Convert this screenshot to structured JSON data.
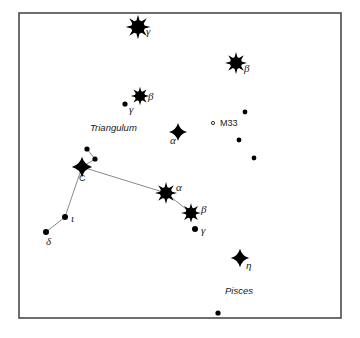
{
  "figure": {
    "background_color": "#ffffff",
    "frame": {
      "x": 19,
      "y": 13,
      "width": 322,
      "height": 305,
      "stroke_color": "#4a4a4a"
    },
    "line_color": "#7b7b7b",
    "star_color": "#000000"
  },
  "chart_data": {
    "type": "scatter",
    "xlabel": "",
    "ylabel": "",
    "grid": false,
    "legend": "none",
    "xlim": [
      19,
      341
    ],
    "ylim": [
      13,
      318
    ],
    "stars": [
      {
        "id": "and-gamma",
        "label": "γ",
        "glyph": "spiked",
        "size": 8.5,
        "x": 138,
        "y": 27,
        "label_dx": 8,
        "label_dy": 8
      },
      {
        "id": "and-beta",
        "label": "β",
        "glyph": "spiked",
        "size": 7.6,
        "x": 236,
        "y": 63,
        "label_dx": 8,
        "label_dy": 9
      },
      {
        "id": "tri-beta",
        "label": "β",
        "glyph": "spiked",
        "size": 6.4,
        "x": 140,
        "y": 96,
        "label_dx": 8,
        "label_dy": 4
      },
      {
        "id": "tri-gamma",
        "label": "γ",
        "glyph": "dot",
        "size": 2.6,
        "x": 125,
        "y": 104,
        "label_dx": 4,
        "label_dy": 9
      },
      {
        "id": "tri-alpha",
        "label": "α",
        "glyph": "diamond",
        "size": 6.2,
        "x": 178,
        "y": 132,
        "label_dx": -8,
        "label_dy": 12
      },
      {
        "id": "field-1",
        "label": "",
        "glyph": "dot",
        "size": 2.4,
        "x": 245,
        "y": 112,
        "label_dx": 0,
        "label_dy": 0
      },
      {
        "id": "field-2",
        "label": "",
        "glyph": "dot",
        "size": 2.4,
        "x": 239,
        "y": 140,
        "label_dx": 0,
        "label_dy": 0
      },
      {
        "id": "field-3",
        "label": "",
        "glyph": "dot",
        "size": 2.4,
        "x": 254,
        "y": 158,
        "label_dx": 0,
        "label_dy": 0
      },
      {
        "id": "psc-c",
        "label": "C",
        "glyph": "diamond",
        "size": 7.0,
        "x": 82,
        "y": 167,
        "label_dx": -3,
        "label_dy": 14
      },
      {
        "id": "psc-c-n1",
        "label": "",
        "glyph": "dot",
        "size": 2.6,
        "x": 87,
        "y": 149,
        "label_dx": 0,
        "label_dy": 0
      },
      {
        "id": "psc-c-n2",
        "label": "",
        "glyph": "dot",
        "size": 2.6,
        "x": 95,
        "y": 159,
        "label_dx": 0,
        "label_dy": 0
      },
      {
        "id": "psc-alpha",
        "label": "α",
        "glyph": "spiked",
        "size": 7.6,
        "x": 166,
        "y": 193,
        "label_dx": 10,
        "label_dy": -2
      },
      {
        "id": "psc-beta",
        "label": "β",
        "glyph": "spiked",
        "size": 6.8,
        "x": 191,
        "y": 213,
        "label_dx": 10,
        "label_dy": 0
      },
      {
        "id": "psc-gamma",
        "label": "γ",
        "glyph": "dot",
        "size": 3.0,
        "x": 195,
        "y": 229,
        "label_dx": 6,
        "label_dy": 5
      },
      {
        "id": "psc-iota",
        "label": "ι",
        "glyph": "dot",
        "size": 3.0,
        "x": 65,
        "y": 217,
        "label_dx": 6,
        "label_dy": 5
      },
      {
        "id": "psc-delta",
        "label": "δ",
        "glyph": "dot",
        "size": 3.0,
        "x": 46,
        "y": 232,
        "label_dx": 0,
        "label_dy": 13
      },
      {
        "id": "psc-eta",
        "label": "η",
        "glyph": "diamond",
        "size": 6.4,
        "x": 240,
        "y": 258,
        "label_dx": 6,
        "label_dy": 11
      },
      {
        "id": "field-4",
        "label": "",
        "glyph": "dot",
        "size": 2.6,
        "x": 218,
        "y": 313,
        "label_dx": 0,
        "label_dy": 0
      }
    ],
    "lines": [
      {
        "from": "psc-c-n1",
        "to": "psc-c-n2"
      },
      {
        "from": "psc-c-n2",
        "to": "psc-c"
      },
      {
        "from": "psc-c",
        "to": "psc-alpha"
      },
      {
        "from": "psc-c",
        "to": "psc-iota"
      },
      {
        "from": "psc-iota",
        "to": "psc-delta"
      },
      {
        "from": "psc-alpha",
        "to": "psc-beta"
      }
    ],
    "deep_sky_objects": [
      {
        "id": "m33",
        "label": "M33",
        "marker": "∘",
        "x": 213,
        "y": 123,
        "label_dx": 7,
        "label_dy": 3
      }
    ],
    "constellation_labels": [
      {
        "id": "triangulum",
        "text": "Triangulum",
        "x": 90,
        "y": 131
      },
      {
        "id": "pisces",
        "text": "Pisces",
        "x": 225,
        "y": 294
      }
    ]
  }
}
